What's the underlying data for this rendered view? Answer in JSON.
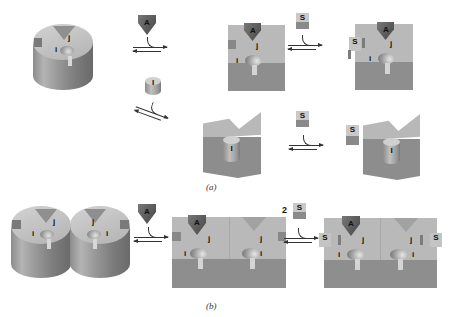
{
  "figure": {
    "panels": [
      {
        "id": "a",
        "caption": "(a)",
        "receptor_label_i": "i",
        "receptor_label_j": "j",
        "ligands": {
          "A": "A",
          "I": "I",
          "S": "S"
        },
        "steps": [
          {
            "from": "cylinder receptor",
            "reagent": "A",
            "to": "block with A bound"
          },
          {
            "from": "block with A bound",
            "reagent": "S",
            "to": "block with A and S bound"
          },
          {
            "from": "cylinder receptor",
            "reagent": "I",
            "to": "wedge block with I bound"
          },
          {
            "from": "wedge block with I bound",
            "reagent": "S",
            "to": "wedge block with I and S"
          }
        ]
      },
      {
        "id": "b",
        "caption": "(b)",
        "receptor_label_i": "i",
        "receptor_label_j": "j",
        "ligands": {
          "A": "A",
          "S": "S"
        },
        "stoichiometry_S": "2",
        "steps": [
          {
            "from": "dimer receptor",
            "reagent": "A",
            "to": "dimer block with A bound"
          },
          {
            "from": "dimer block with A bound",
            "reagent": "2 S",
            "to": "dimer block with A and 2 S"
          }
        ]
      }
    ]
  },
  "labels": {
    "i": "i",
    "j": "j",
    "A": "A",
    "S": "S",
    "I": "I",
    "two": "2",
    "cap_a": "(a)",
    "cap_b": "(b)"
  },
  "colors": {
    "light_face": "#b9b9b9",
    "dark_face": "#8e8e8e",
    "ligand_A": "#5a5a5a",
    "background": "#ffffff"
  }
}
